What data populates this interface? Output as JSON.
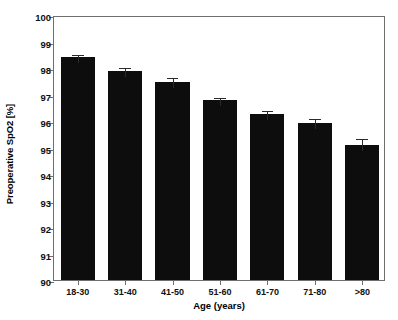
{
  "chart_data": {
    "type": "bar",
    "title": "",
    "xlabel": "Age (years)",
    "ylabel": "Preoperative SpO2 [%]",
    "categories": [
      "18-30",
      "31-40",
      "41-50",
      "51-60",
      "61-70",
      "71-80",
      ">80"
    ],
    "values": [
      98.4,
      97.88,
      97.48,
      96.78,
      96.25,
      95.93,
      95.08
    ],
    "errors": [
      0.17,
      0.18,
      0.2,
      0.17,
      0.2,
      0.22,
      0.3
    ],
    "ylim": [
      90,
      100
    ],
    "ytick_labels": [
      "90",
      "91",
      "92",
      "93",
      "94",
      "95",
      "96",
      "97",
      "98",
      "99",
      "100"
    ],
    "ytick_values": [
      90,
      91,
      92,
      93,
      94,
      95,
      96,
      97,
      98,
      99,
      100
    ],
    "grid": false,
    "legend": "none",
    "bar_color": "#0d0d0d",
    "error_color": "#2a2a2a",
    "axis_color": "#6e6e6e",
    "background": "#ffffff"
  }
}
